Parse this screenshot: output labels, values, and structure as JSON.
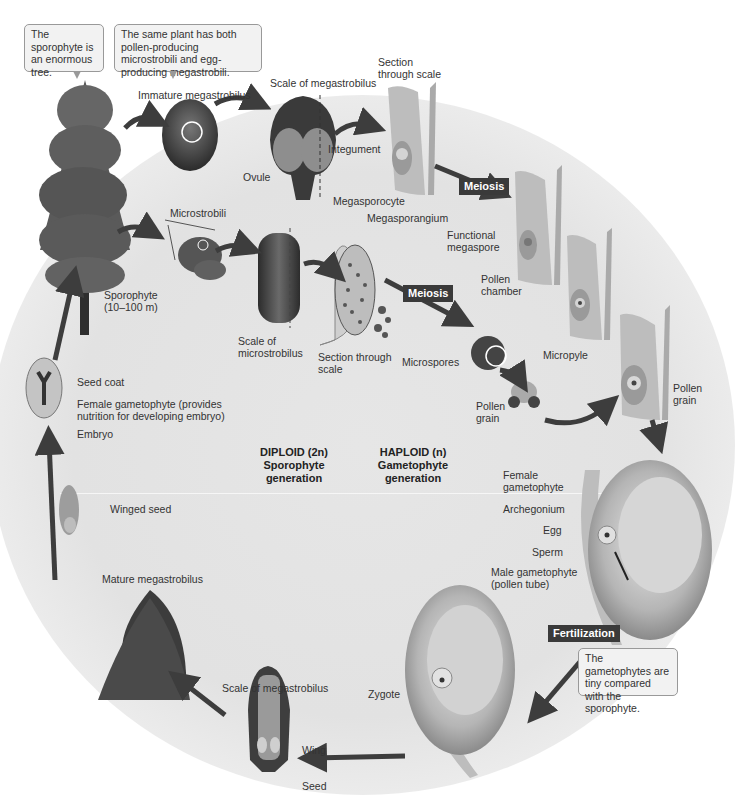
{
  "callouts": {
    "sporophyte_tree": "The sporophyte is an enormous tree.",
    "same_plant": "The same plant has both pollen-producing microstrobili and egg-producing megastrobili.",
    "gametophytes_tiny": "The gametophytes are tiny compared with the sporophyte."
  },
  "labels": {
    "immature_megastrobilus": "Immature megastrobilus",
    "scale_of_megastrobilus_top": "Scale of megastrobilus",
    "section_through_scale_top_1": "Section",
    "section_through_scale_top_2": "through scale",
    "integument": "Integument",
    "ovule": "Ovule",
    "megasporocyte": "Megasporocyte",
    "megasporangium": "Megasporangium",
    "functional_megaspore_1": "Functional",
    "functional_megaspore_2": "megaspore",
    "pollen_chamber_1": "Pollen",
    "pollen_chamber_2": "chamber",
    "micropyle": "Micropyle",
    "pollen_grain_right_1": "Pollen",
    "pollen_grain_right_2": "grain",
    "microstrobili": "Microstrobili",
    "sporophyte_1": "Sporophyte",
    "sporophyte_2": "(10–100 m)",
    "scale_of_microstrobilus_1": "Scale of",
    "scale_of_microstrobilus_2": "microstrobilus",
    "section_through_scale_mid_1": "Section through",
    "section_through_scale_mid_2": "scale",
    "microspores": "Microspores",
    "pollen_grain_mid_1": "Pollen",
    "pollen_grain_mid_2": "grain",
    "seed_coat": "Seed coat",
    "female_gametophyte_seed_1": "Female gametophyte (provides",
    "female_gametophyte_seed_2": "nutrition for developing embryo)",
    "embryo": "Embryo",
    "winged_seed": "Winged seed",
    "female_gametophyte_1": "Female",
    "female_gametophyte_2": "gametophyte",
    "archegonium": "Archegonium",
    "egg": "Egg",
    "sperm": "Sperm",
    "male_gametophyte_1": "Male gametophyte",
    "male_gametophyte_2": "(pollen tube)",
    "mature_megastrobilus": "Mature megastrobilus",
    "scale_of_megastrobilus_bottom": "Scale of megastrobilus",
    "wing": "Wing",
    "seed": "Seed",
    "zygote": "Zygote"
  },
  "badges": {
    "meiosis_mega": "Meiosis",
    "meiosis_micro": "Meiosis",
    "fertilization": "Fertilization"
  },
  "generations": {
    "diploid_1": "DIPLOID (2n)",
    "diploid_2": "Sporophyte",
    "diploid_3": "generation",
    "haploid_1": "HAPLOID (n)",
    "haploid_2": "Gametophyte",
    "haploid_3": "generation"
  },
  "colors": {
    "arrow": "#3d3d3d",
    "badge_bg": "#3a3a3a",
    "tissue": "#bdbdbd",
    "dark_tissue": "#4a4a4a"
  }
}
